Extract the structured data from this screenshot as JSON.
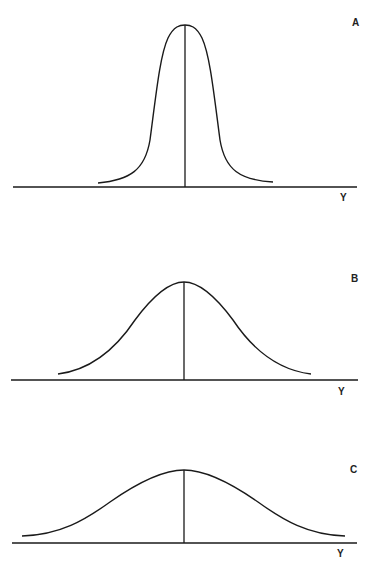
{
  "panels": [
    {
      "label": "A",
      "axis_label": "Y",
      "description": "narrow, tall distribution (leptokurtic)"
    },
    {
      "label": "B",
      "axis_label": "Y",
      "description": "medium-width distribution (mesokurtic)"
    },
    {
      "label": "C",
      "axis_label": "Y",
      "description": "wide, flat distribution (platykurtic)"
    }
  ],
  "colors": {
    "line": "#1a1a1a",
    "background": "#ffffff"
  }
}
